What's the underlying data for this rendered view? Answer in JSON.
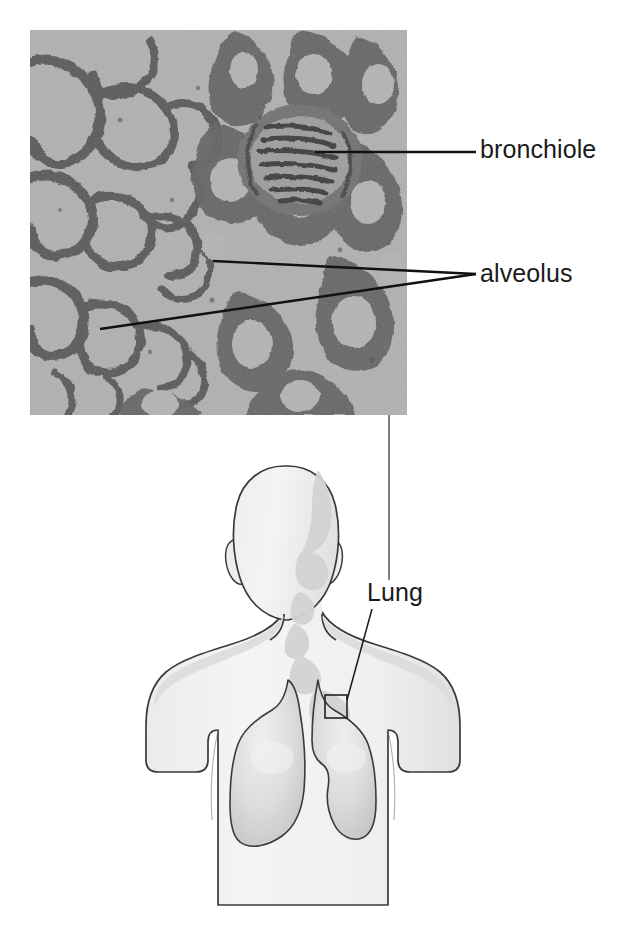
{
  "figure": {
    "width": 634,
    "height": 925,
    "background_color": "#ffffff"
  },
  "micrograph": {
    "name": "lung-tissue-micrograph",
    "description": "Light micrograph of lung tissue showing alveolar spaces and a bronchiole in cross-section",
    "x": 30,
    "y": 30,
    "width": 377,
    "height": 385,
    "tone_light": "#b2b2b2",
    "tone_mid": "#8a8a8a",
    "tone_dark": "#4a4a4a",
    "tone_darkest": "#2e2e2e"
  },
  "labels": {
    "bronchiole": "bronchiole",
    "alveolus": "alveolus",
    "lung": "Lung"
  },
  "leaders": {
    "bronchiole": {
      "from_x": 315,
      "from_y": 152,
      "to_x": 476,
      "to_y": 152
    },
    "alveolus_upper": {
      "from_x": 213,
      "from_y": 261,
      "to_x": 476,
      "to_y": 274
    },
    "alveolus_lower": {
      "from_x": 100,
      "from_y": 329,
      "to_x": 476,
      "to_y": 274
    },
    "magnifier": {
      "from_x": 389,
      "from_y": 415,
      "to_x": 389,
      "to_y": 580
    },
    "lung": {
      "from_x": 347,
      "from_y": 700,
      "to_x": 372,
      "to_y": 609
    }
  },
  "body_diagram": {
    "name": "human-torso-front-view",
    "description": "Front view outline of a human head, neck, shoulders and upper torso with both lungs shown in place",
    "skin_fill": "#f1f1f1",
    "skin_shadow": "#d2d2d2",
    "lung_fill": "#dcdcdc",
    "lung_shadow": "#c9c9c9",
    "lung_highlight": "#efefef",
    "outline_color": "#3a3a3a",
    "outline_width": 1.6
  },
  "roi_box": {
    "name": "region-of-interest-box",
    "x": 325,
    "y": 695,
    "width": 22,
    "height": 23,
    "stroke": "#222222"
  },
  "colors": {
    "text": "#1a1a1a",
    "leader_line": "#111111",
    "page_background": "#ffffff"
  }
}
